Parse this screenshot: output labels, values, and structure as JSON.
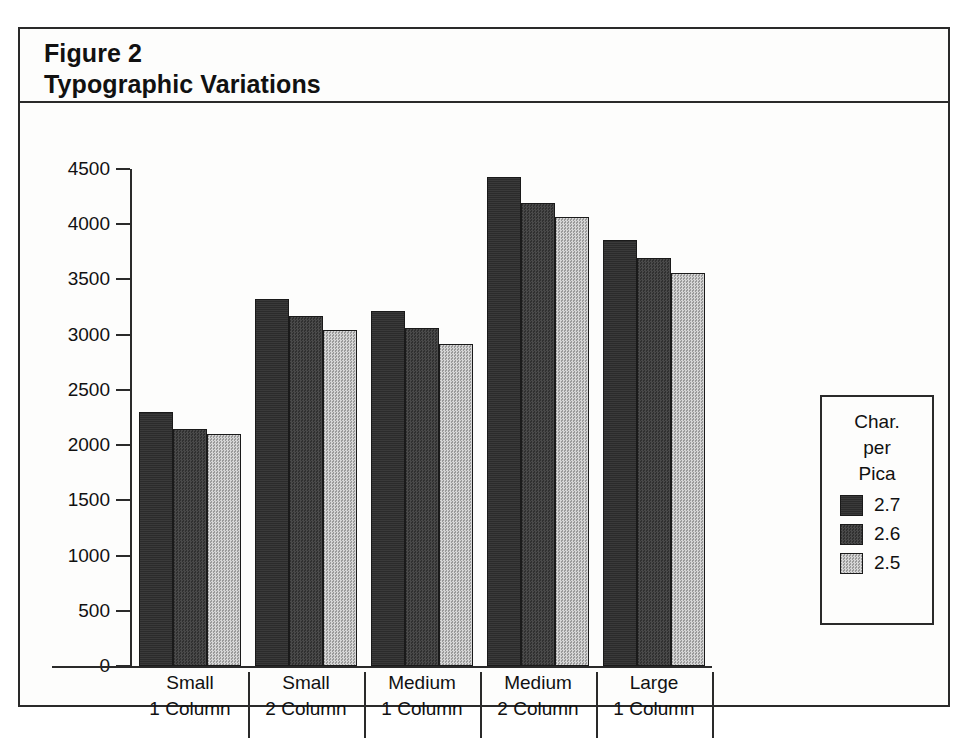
{
  "figure": {
    "title_line1": "Figure 2",
    "title_line2": "Typographic Variations"
  },
  "legend": {
    "title_lines": [
      "Char.",
      "per",
      "Pica"
    ],
    "entries": [
      {
        "label": "2.7",
        "color": "#2b2b2b"
      },
      {
        "label": "2.6",
        "color": "#3e3e3e"
      },
      {
        "label": "2.5",
        "color": "#b9b9b9"
      }
    ]
  },
  "chart_data": {
    "type": "bar",
    "xlabel": "",
    "ylabel": "",
    "ylim": [
      0,
      4500
    ],
    "yticks": [
      0,
      500,
      1000,
      1500,
      2000,
      2500,
      3000,
      3500,
      4000,
      4500
    ],
    "ytick_labels": [
      "0",
      "500",
      "1000",
      "1500",
      "2000",
      "2500",
      "3000",
      "3500",
      "4000",
      "4500"
    ],
    "grid": false,
    "legend_position": "right",
    "legend_title": "Char. per Pica",
    "categories": [
      "Small 1 Column",
      "Small 2 Column",
      "Medium 1 Column",
      "Medium 2 Column",
      "Large 1 Column"
    ],
    "category_lines": [
      [
        "Small",
        "1 Column"
      ],
      [
        "Small",
        "2 Column"
      ],
      [
        "Medium",
        "1 Column"
      ],
      [
        "Medium",
        "2 Column"
      ],
      [
        "Large",
        "1 Column"
      ]
    ],
    "series": [
      {
        "name": "2.7",
        "color": "#2b2b2b",
        "values": [
          2300,
          3320,
          3210,
          4430,
          3860
        ]
      },
      {
        "name": "2.6",
        "color": "#3e3e3e",
        "values": [
          2150,
          3170,
          3060,
          4190,
          3690
        ]
      },
      {
        "name": "2.5",
        "color": "#b9b9b9",
        "values": [
          2100,
          3040,
          2920,
          4070,
          3560
        ]
      }
    ]
  }
}
